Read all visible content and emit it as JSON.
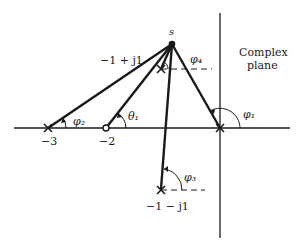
{
  "diagram": {
    "plane_label_line1": "Complex",
    "plane_label_line2": "plane",
    "test_point_label": "s",
    "points": {
      "pole_upper": "−1 + j1",
      "pole_lower": "−1 − j1",
      "pole_minus3": "−3",
      "zero_minus2": "−2"
    },
    "angles": {
      "phi1": "φ₁",
      "phi2": "φ₂",
      "phi3": "φ₃",
      "phi4": "φ₄",
      "theta1": "θ₁"
    },
    "colors": {
      "ink": "#1a1a1a",
      "background": "#ffffff"
    }
  }
}
